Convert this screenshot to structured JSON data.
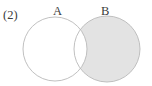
{
  "figure": {
    "item_number": "(2)",
    "type": "venn-diagram",
    "set_count": 2
  },
  "labels": {
    "item": "(2)",
    "set_a": "A",
    "set_b": "B"
  },
  "colors": {
    "stroke": "#b9b9b9",
    "shaded_fill": "#e3e3e3",
    "unshaded_fill": "#ffffff",
    "text": "#3b3b3b",
    "background": "#ffffff"
  },
  "geometry": {
    "circle_a": {
      "cx": 55,
      "cy": 49,
      "r": 32
    },
    "circle_b": {
      "cx": 107,
      "cy": 49,
      "r": 33
    },
    "stroke_width": 0.9
  },
  "regions": [
    {
      "name": "a-only",
      "description": "A minus B",
      "shaded": false
    },
    {
      "name": "intersection",
      "description": "A intersect B",
      "shaded": false
    },
    {
      "name": "b-only",
      "description": "B minus A",
      "shaded": true
    }
  ]
}
